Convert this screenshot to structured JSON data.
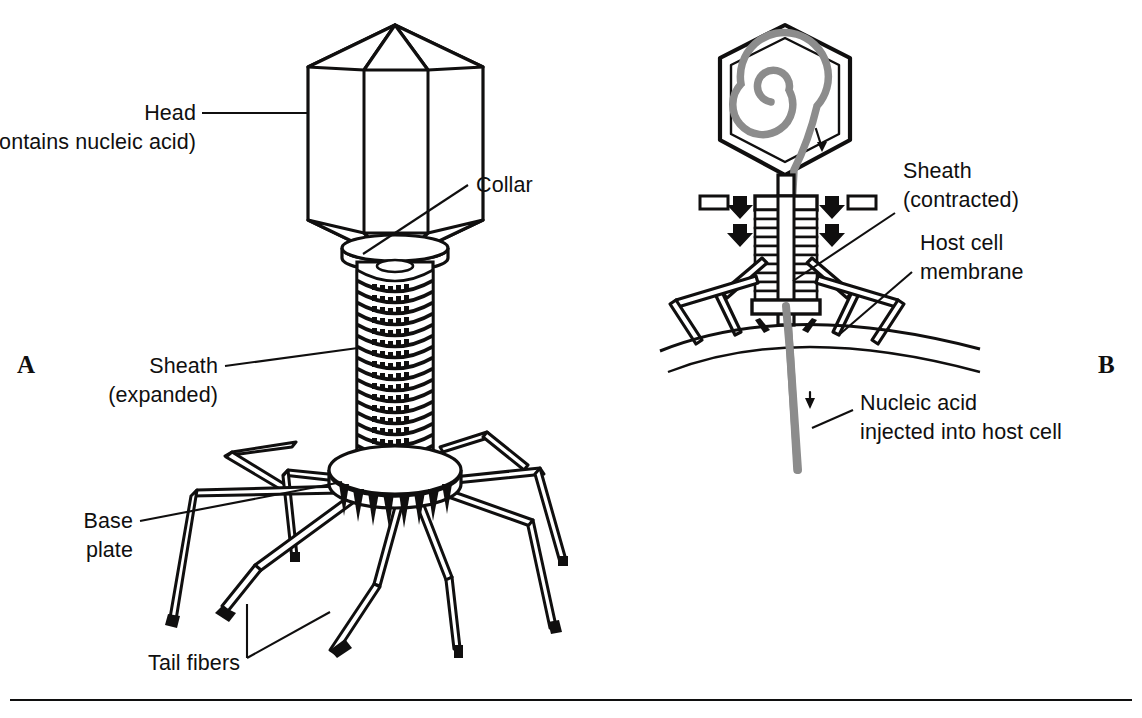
{
  "figure": {
    "background_color": "#ffffff",
    "ink_color": "#100f0f",
    "nucleic_acid_color": "#8c8c8c",
    "rule_color": "#100f0f"
  },
  "panels": [
    {
      "id": "A",
      "letter": "A",
      "caption": "Intact bacteriophage with expanded sheath",
      "labels": [
        {
          "name": "head",
          "line1": "Head",
          "line2": "(contains nucleic acid)"
        },
        {
          "name": "collar",
          "line1": "Collar",
          "line2": ""
        },
        {
          "name": "sheath",
          "line1": "Sheath",
          "line2": "(expanded)"
        },
        {
          "name": "base-plate",
          "line1": "Base",
          "line2": "plate"
        },
        {
          "name": "tail-fibers",
          "line1": "Tail fibers",
          "line2": ""
        }
      ]
    },
    {
      "id": "B",
      "letter": "B",
      "caption": "Bacteriophage attached to host cell injecting nucleic acid",
      "labels": [
        {
          "name": "sheath-contracted",
          "line1": "Sheath",
          "line2": "(contracted)"
        },
        {
          "name": "host-cell-membrane",
          "line1": "Host cell",
          "line2": "membrane"
        },
        {
          "name": "nucleic-acid-injected",
          "line1": "Nucleic acid",
          "line2": "injected into host cell"
        }
      ]
    }
  ],
  "label_text": {
    "head_line1": "Head",
    "head_line2": "(contains nucleic acid)",
    "collar": "Collar",
    "sheath_line1": "Sheath",
    "sheath_line2": "(expanded)",
    "base_line1": "Base",
    "base_line2": "plate",
    "tail_fibers": "Tail fibers",
    "sheath_c_line1": "Sheath",
    "sheath_c_line2": "(contracted)",
    "host_line1": "Host cell",
    "host_line2": "membrane",
    "nucleic_line1": "Nucleic acid",
    "nucleic_line2": "injected into host cell",
    "panel_a": "A",
    "panel_b": "B"
  }
}
